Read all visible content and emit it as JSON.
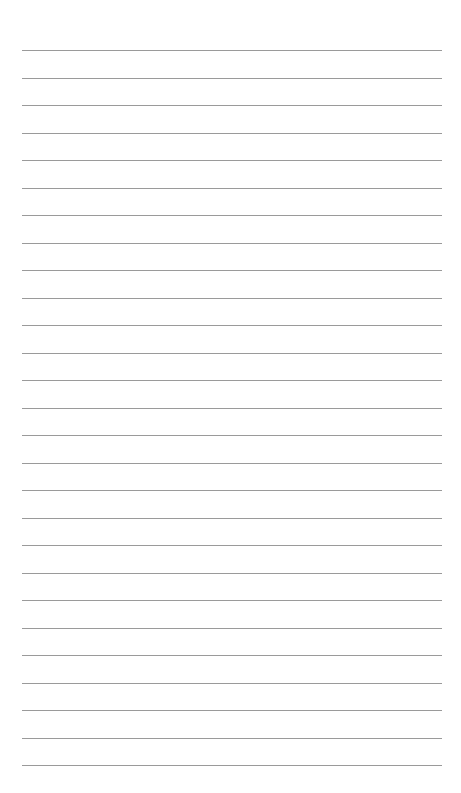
{
  "page": {
    "type": "lined-paper",
    "background_color": "#ffffff",
    "line_color": "#9a9a9a",
    "line_count": 27,
    "first_line_y": 50,
    "line_spacing": 27.5,
    "line_left": 22,
    "line_right": 442,
    "text": ""
  }
}
